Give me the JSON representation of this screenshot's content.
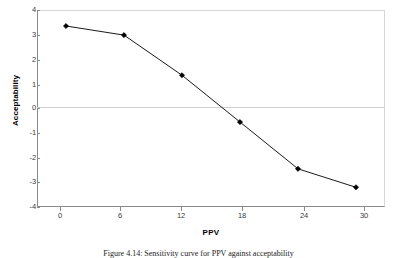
{
  "figure": {
    "caption": "Figure 4.14: Sensitivity curve for PPV against acceptability"
  },
  "chart_data": {
    "type": "line",
    "title": "",
    "xlabel": "PPV",
    "ylabel": "Acceptability",
    "x": [
      0,
      6,
      12,
      18,
      24,
      30
    ],
    "values": [
      3.35,
      2.98,
      1.35,
      -0.55,
      -2.45,
      -3.2
    ],
    "series": [
      {
        "name": "Acceptability",
        "values": [
          3.35,
          2.98,
          1.35,
          -0.55,
          -2.45,
          -3.2
        ]
      }
    ],
    "xticks": [
      "0",
      "6",
      "12",
      "18",
      "24",
      "30"
    ],
    "yticks": [
      "4",
      "3",
      "2",
      "1",
      "0",
      "-1",
      "-2",
      "-3",
      "-4"
    ],
    "xlim": [
      -3,
      33
    ],
    "ylim": [
      -4,
      4
    ],
    "grid": "zero-line-only",
    "legend": "none",
    "marker": "filled-diamond",
    "line_color": "#000000",
    "marker_color": "#000000",
    "plot_background": "#ffffff",
    "axis_color": "#8a8a8a"
  }
}
